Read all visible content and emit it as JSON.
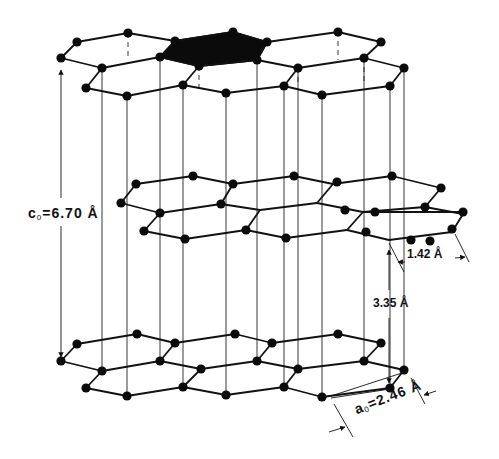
{
  "figure": {
    "labels": {
      "c0": {
        "symbol": "c",
        "sub": "0",
        "text": "=6.70 Å"
      },
      "a0": {
        "symbol": "a",
        "sub": "0",
        "text": "=2.46 Å"
      },
      "bond_length": "1.42 Å",
      "interlayer_spacing": "3.35 Å"
    },
    "colors": {
      "ink": "#111111",
      "background": "#ffffff",
      "highlight_cell": "#0b0b0b"
    },
    "layers": [
      {
        "name": "top-layer-A",
        "atoms": [
          [
            61,
            58
          ],
          [
            77,
            42
          ],
          [
            128,
            33
          ],
          [
            175,
            41
          ],
          [
            160,
            57
          ],
          [
            102,
            68
          ],
          [
            86,
            88
          ],
          [
            127,
            96
          ],
          [
            183,
            85
          ],
          [
            226,
            93
          ],
          [
            233,
            32
          ],
          [
            267,
            42
          ],
          [
            257,
            60
          ],
          [
            199,
            66
          ],
          [
            338,
            32
          ],
          [
            381,
            42
          ],
          [
            364,
            58
          ],
          [
            404,
            68
          ],
          [
            322,
            95
          ],
          [
            298,
            68
          ],
          [
            284,
            86
          ],
          [
            390,
            86
          ]
        ],
        "bonds": [
          [
            61,
            58,
            77,
            42
          ],
          [
            77,
            42,
            128,
            33
          ],
          [
            128,
            33,
            175,
            41
          ],
          [
            175,
            41,
            160,
            57
          ],
          [
            160,
            57,
            102,
            68
          ],
          [
            102,
            68,
            61,
            58
          ],
          [
            102,
            68,
            86,
            88
          ],
          [
            86,
            88,
            127,
            96
          ],
          [
            127,
            96,
            183,
            85
          ],
          [
            183,
            85,
            199,
            66
          ],
          [
            199,
            66,
            160,
            57
          ],
          [
            199,
            66,
            257,
            60
          ],
          [
            257,
            60,
            298,
            68
          ],
          [
            298,
            68,
            284,
            86
          ],
          [
            284,
            86,
            226,
            93
          ],
          [
            226,
            93,
            183,
            85
          ],
          [
            257,
            60,
            267,
            42
          ],
          [
            267,
            42,
            338,
            32
          ],
          [
            338,
            32,
            381,
            42
          ],
          [
            381,
            42,
            364,
            58
          ],
          [
            364,
            58,
            298,
            68
          ],
          [
            364,
            58,
            404,
            68
          ],
          [
            404,
            68,
            390,
            86
          ],
          [
            390,
            86,
            322,
            95
          ],
          [
            322,
            95,
            284,
            86
          ],
          [
            175,
            41,
            233,
            32
          ],
          [
            233,
            32,
            267,
            42
          ]
        ],
        "highlight_hexagon": [
          [
            175,
            41
          ],
          [
            233,
            32
          ],
          [
            267,
            42
          ],
          [
            257,
            60
          ],
          [
            199,
            66
          ],
          [
            160,
            57
          ]
        ]
      },
      {
        "name": "middle-layer-B",
        "atoms": [
          [
            136,
            184
          ],
          [
            193,
            176
          ],
          [
            233,
            184
          ],
          [
            221,
            204
          ],
          [
            160,
            213
          ],
          [
            121,
            203
          ],
          [
            144,
            231
          ],
          [
            185,
            239
          ],
          [
            246,
            230
          ],
          [
            286,
            238
          ],
          [
            294,
            176
          ],
          [
            337,
            182
          ],
          [
            392,
            176
          ],
          [
            441,
            188
          ],
          [
            425,
            207
          ],
          [
            375,
            212
          ],
          [
            366,
            232
          ],
          [
            430,
            241
          ],
          [
            345,
            210
          ],
          [
            411,
            240
          ],
          [
            463,
            212
          ],
          [
            452,
            229
          ]
        ],
        "bonds": [
          [
            121,
            203,
            136,
            184
          ],
          [
            136,
            184,
            193,
            176
          ],
          [
            193,
            176,
            233,
            184
          ],
          [
            233,
            184,
            221,
            204
          ],
          [
            221,
            204,
            160,
            213
          ],
          [
            160,
            213,
            121,
            203
          ],
          [
            160,
            213,
            144,
            231
          ],
          [
            144,
            231,
            185,
            239
          ],
          [
            185,
            239,
            246,
            230
          ],
          [
            246,
            230,
            260,
            210
          ],
          [
            260,
            210,
            221,
            204
          ],
          [
            221,
            204,
            221,
            204
          ],
          [
            260,
            210,
            317,
            203
          ],
          [
            317,
            203,
            333,
            184
          ],
          [
            333,
            184,
            294,
            176
          ],
          [
            294,
            176,
            233,
            184
          ],
          [
            333,
            184,
            392,
            176
          ],
          [
            392,
            176,
            441,
            188
          ],
          [
            441,
            188,
            425,
            207
          ],
          [
            425,
            207,
            363,
            212
          ],
          [
            363,
            212,
            317,
            203
          ],
          [
            363,
            212,
            347,
            230
          ],
          [
            347,
            230,
            286,
            238
          ],
          [
            286,
            238,
            246,
            230
          ],
          [
            363,
            212,
            463,
            212
          ],
          [
            425,
            207,
            463,
            214
          ],
          [
            463,
            214,
            452,
            232
          ],
          [
            452,
            232,
            389,
            240
          ],
          [
            389,
            240,
            347,
            230
          ]
        ]
      },
      {
        "name": "bottom-layer-A",
        "atoms": [
          [
            61,
            361
          ],
          [
            77,
            344
          ],
          [
            137,
            334
          ],
          [
            175,
            343
          ],
          [
            160,
            361
          ],
          [
            102,
            371
          ],
          [
            86,
            388
          ],
          [
            127,
            396
          ],
          [
            183,
            387
          ],
          [
            226,
            395
          ],
          [
            235,
            334
          ],
          [
            272,
            343
          ],
          [
            257,
            361
          ],
          [
            201,
            369
          ],
          [
            338,
            334
          ],
          [
            381,
            343
          ],
          [
            364,
            361
          ],
          [
            404,
            370
          ],
          [
            390,
            388
          ],
          [
            322,
            397
          ],
          [
            298,
            369
          ],
          [
            284,
            387
          ]
        ],
        "bonds": [
          [
            61,
            361,
            77,
            344
          ],
          [
            77,
            344,
            137,
            334
          ],
          [
            137,
            334,
            175,
            343
          ],
          [
            175,
            343,
            160,
            361
          ],
          [
            160,
            361,
            102,
            371
          ],
          [
            102,
            371,
            61,
            361
          ],
          [
            102,
            371,
            86,
            388
          ],
          [
            86,
            388,
            127,
            396
          ],
          [
            127,
            396,
            183,
            387
          ],
          [
            183,
            387,
            201,
            369
          ],
          [
            201,
            369,
            160,
            361
          ],
          [
            201,
            369,
            257,
            361
          ],
          [
            257,
            361,
            298,
            369
          ],
          [
            298,
            369,
            284,
            387
          ],
          [
            284,
            387,
            226,
            395
          ],
          [
            226,
            395,
            183,
            387
          ],
          [
            257,
            361,
            272,
            343
          ],
          [
            272,
            343,
            235,
            334
          ],
          [
            235,
            334,
            175,
            343
          ],
          [
            272,
            343,
            338,
            334
          ],
          [
            338,
            334,
            381,
            343
          ],
          [
            381,
            343,
            364,
            361
          ],
          [
            364,
            361,
            298,
            369
          ],
          [
            364,
            361,
            404,
            370
          ],
          [
            404,
            370,
            390,
            388
          ],
          [
            390,
            388,
            322,
            397
          ],
          [
            322,
            397,
            284,
            387
          ]
        ]
      }
    ],
    "vertical_solid_x": [
      127,
      160,
      183,
      235,
      257,
      297,
      364,
      389
    ],
    "vertical_dashed_x": [
      135,
      160,
      233,
      258,
      338,
      364
    ],
    "c0_arrow": {
      "x": 61,
      "y1": 62,
      "y2": 357
    },
    "interlayer_arrow": {
      "x": 389,
      "y1": 243,
      "y2": 385
    }
  }
}
